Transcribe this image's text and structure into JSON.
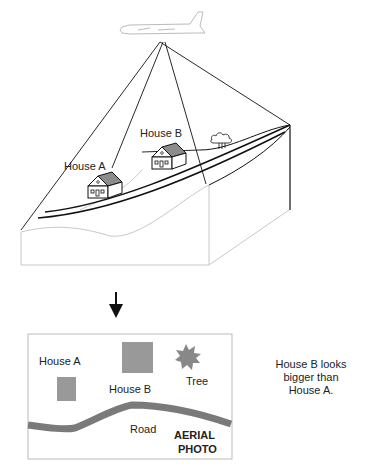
{
  "scene": {
    "aircraft": "airplane",
    "labels": {
      "house_a": "House A",
      "house_b": "House B"
    },
    "tree": "tree"
  },
  "arrow": "down-arrow",
  "aerial_photo": {
    "labels": {
      "house_a": "House A",
      "house_b": "House B",
      "tree": "Tree",
      "road": "Road",
      "title_line1": "AERIAL",
      "title_line2": "PHOTO"
    }
  },
  "note": {
    "line1": "House B looks",
    "line2": "bigger than",
    "line3": "House A."
  },
  "colors": {
    "house_roof": "#8c8c8c",
    "photo_shape": "#999999",
    "road": "#7a7a7a",
    "line": "#111111",
    "terrain_light": "#c8c8c8"
  }
}
